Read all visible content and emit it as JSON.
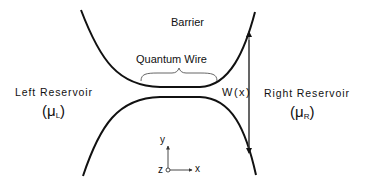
{
  "diagram": {
    "labels": {
      "barrier": "Barrier",
      "quantum_wire": "Quantum Wire",
      "left_reservoir": "Left Reservoir",
      "left_mu_symbol": "(μ",
      "left_mu_sub": "L",
      "left_mu_close": ")",
      "right_reservoir": "Right Reservoir",
      "right_mu_symbol": "(μ",
      "right_mu_sub": "R",
      "right_mu_close": ")",
      "width": "W(x)",
      "axis_x": "x",
      "axis_y": "y",
      "axis_z": "z"
    },
    "colors": {
      "line": "#111111",
      "arrow": "#222222",
      "brace": "#555555",
      "background": "#ffffff"
    }
  }
}
